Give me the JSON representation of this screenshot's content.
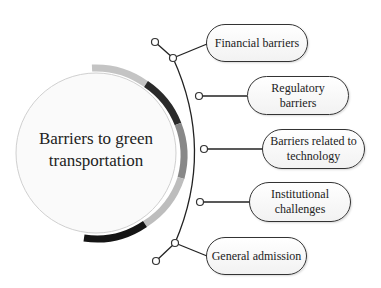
{
  "diagram": {
    "center": {
      "line1": "Barriers to green",
      "line2": "transportation"
    },
    "branches": [
      {
        "label": "Financial barriers"
      },
      {
        "label": "Regulatory barriers"
      },
      {
        "label": "Barriers related to technology"
      },
      {
        "label": "Institutional challenges"
      },
      {
        "label": "General admission"
      }
    ]
  },
  "colors": {
    "ring_light": "#c8c8c8",
    "ring_dark": "#2a2a2a",
    "ring_mid": "#8a8a8a",
    "line": "#222222"
  }
}
